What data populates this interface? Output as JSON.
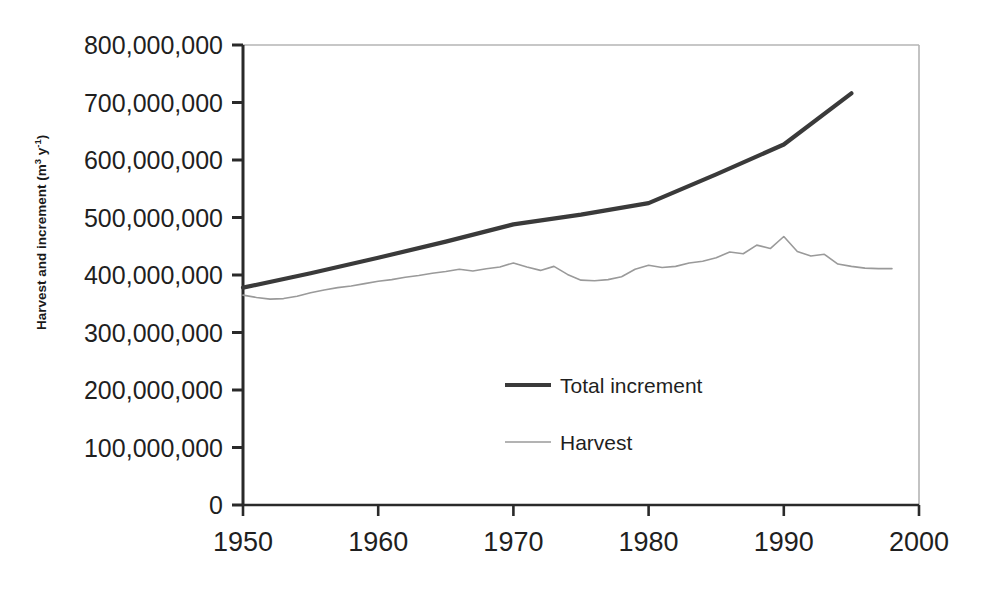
{
  "chart_data": {
    "type": "line",
    "title": "",
    "xlabel": "",
    "ylabel": "Harvest and increment (m3 y-1)",
    "ylabel_parts": {
      "main": "Harvest and increment (m",
      "sup1": "3",
      "mid": " y",
      "sup2": "-1",
      "tail": ")"
    },
    "xlim": [
      1950,
      2000
    ],
    "ylim": [
      0,
      800000000
    ],
    "grid": false,
    "legend_position": "center",
    "x_ticks": [
      1950,
      1960,
      1970,
      1980,
      1990,
      2000
    ],
    "x_tick_labels": [
      "1950",
      "1960",
      "1970",
      "1980",
      "1990",
      "2000"
    ],
    "y_ticks": [
      0,
      100000000,
      200000000,
      300000000,
      400000000,
      500000000,
      600000000,
      700000000,
      800000000
    ],
    "y_tick_labels": [
      "0",
      "100,000,000",
      "200,000,000",
      "300,000,000",
      "400,000,000",
      "500,000,000",
      "600,000,000",
      "700,000,000",
      "800,000,000"
    ],
    "series": [
      {
        "name": "Total increment",
        "color": "#3a3a3a",
        "line_width": 4.2,
        "x": [
          1950,
          1955,
          1960,
          1965,
          1970,
          1975,
          1980,
          1985,
          1990,
          1995
        ],
        "values": [
          378000000,
          403000000,
          430000000,
          458000000,
          488000000,
          505000000,
          525000000,
          575000000,
          627000000,
          716000000
        ]
      },
      {
        "name": "Harvest",
        "color": "#9a9a9a",
        "line_width": 1.6,
        "x": [
          1950,
          1951,
          1952,
          1953,
          1954,
          1955,
          1956,
          1957,
          1958,
          1959,
          1960,
          1961,
          1962,
          1963,
          1964,
          1965,
          1966,
          1967,
          1968,
          1969,
          1970,
          1971,
          1972,
          1973,
          1974,
          1975,
          1976,
          1977,
          1978,
          1979,
          1980,
          1981,
          1982,
          1983,
          1984,
          1985,
          1986,
          1987,
          1988,
          1989,
          1990,
          1991,
          1992,
          1993,
          1994,
          1995,
          1996,
          1997,
          1998
        ],
        "values": [
          365000000,
          361000000,
          358000000,
          359000000,
          363000000,
          369000000,
          374000000,
          378000000,
          381000000,
          385000000,
          389000000,
          392000000,
          396000000,
          399000000,
          403000000,
          406000000,
          410000000,
          407000000,
          411000000,
          414000000,
          421000000,
          414000000,
          408000000,
          415000000,
          401000000,
          391000000,
          390000000,
          392000000,
          397000000,
          410000000,
          417000000,
          413000000,
          415000000,
          421000000,
          424000000,
          430000000,
          440000000,
          437000000,
          452000000,
          446000000,
          467000000,
          441000000,
          433000000,
          436000000,
          419000000,
          415000000,
          412000000,
          411000000,
          411000000
        ]
      }
    ],
    "legend": [
      {
        "label": "Total increment",
        "color": "#3a3a3a",
        "line_width": 4.2
      },
      {
        "label": "Harvest",
        "color": "#9a9a9a",
        "line_width": 1.6
      }
    ],
    "axis_color": "#2a2a2a",
    "frame_color": "#b4b4b4"
  }
}
